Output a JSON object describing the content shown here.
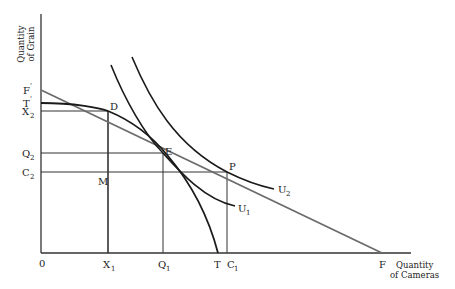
{
  "diagram": {
    "title": "",
    "type": "economics-trade-gains",
    "axes": {
      "y_label_line1": "Quantity",
      "y_label_line2": "of Grain",
      "x_label_line1": "Quantity",
      "x_label_line2": "of Cameras",
      "origin": "0"
    },
    "y_ticks": [
      {
        "base": "F",
        "sup": "'",
        "y": 90
      },
      {
        "base": "T",
        "sup": "'",
        "y": 103
      },
      {
        "base": "X",
        "sub": "2",
        "y": 111
      },
      {
        "base": "Q",
        "sub": "2",
        "y": 153
      },
      {
        "base": "C",
        "sub": "2",
        "y": 172
      }
    ],
    "x_ticks": [
      {
        "base": "X",
        "sub": "1",
        "x": 108
      },
      {
        "base": "Q",
        "sub": "1",
        "x": 163
      },
      {
        "base": "T",
        "x": 218
      },
      {
        "base": "C",
        "sub": "1",
        "x": 227
      },
      {
        "base": "F",
        "x": 382
      }
    ],
    "points": {
      "D": "D",
      "E": "E",
      "P": "P",
      "M": "M"
    },
    "curves": {
      "U1": {
        "base": "U",
        "sub": "1"
      },
      "U2": {
        "base": "U",
        "sub": "2"
      },
      "transformation_curve": "T'T",
      "trade_line": "F'F"
    },
    "colors": {
      "ink": "#1a1a1a",
      "trade_line": "#6b6b6b",
      "background": "#ffffff"
    }
  }
}
